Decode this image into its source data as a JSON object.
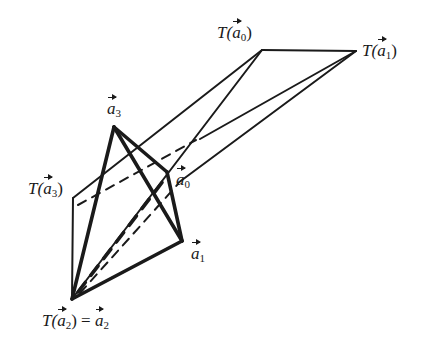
{
  "diagram": {
    "stroke_color": "#1a1a1a",
    "vertices": {
      "a0": {
        "x": 167,
        "y": 172
      },
      "a1": {
        "x": 182,
        "y": 241
      },
      "a2": {
        "x": 72,
        "y": 299
      },
      "a3": {
        "x": 114,
        "y": 127
      },
      "Ta0": {
        "x": 262,
        "y": 50
      },
      "Ta1": {
        "x": 356,
        "y": 51
      },
      "Ta3": {
        "x": 73,
        "y": 198
      }
    },
    "labels": {
      "a3": {
        "prefix": "",
        "var": "a",
        "sub": "3",
        "suffix": ""
      },
      "a0": {
        "prefix": "",
        "var": "a",
        "sub": "0",
        "suffix": ""
      },
      "a1": {
        "prefix": "",
        "var": "a",
        "sub": "1",
        "suffix": ""
      },
      "Ta0": {
        "prefix": "T(",
        "var": "a",
        "sub": "0",
        "suffix": ")"
      },
      "Ta1": {
        "prefix": "T(",
        "var": "a",
        "sub": "1",
        "suffix": ")"
      },
      "Ta3": {
        "prefix": "T(",
        "var": "a",
        "sub": "3",
        "suffix": ")"
      },
      "Ta2": {
        "prefix": "T(",
        "var": "a",
        "sub": "2",
        "suffix": ") = ",
        "var2": "a",
        "sub2": "2"
      }
    }
  }
}
